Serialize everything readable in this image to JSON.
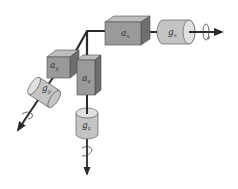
{
  "diagram": {
    "type": "imu-sensor-axes",
    "colors": {
      "background": "#ffffff",
      "box_front": "#9a9a9a",
      "box_top": "#bdbdbd",
      "box_side": "#6e6e6e",
      "cylinder_body": "#c4c4c4",
      "cylinder_cap": "#e0e0e0",
      "axis_line": "#2a2a2a",
      "outline": "#4a4a4a"
    },
    "accelerometers": [
      {
        "id": "ax",
        "symbol": "a",
        "subscript": "x"
      },
      {
        "id": "ay",
        "symbol": "a",
        "subscript": "y"
      },
      {
        "id": "az",
        "symbol": "a",
        "subscript": "z"
      }
    ],
    "gyroscopes": [
      {
        "id": "gx",
        "symbol": "g",
        "subscript": "x"
      },
      {
        "id": "gy",
        "symbol": "g",
        "subscript": "y"
      },
      {
        "id": "gz",
        "symbol": "g",
        "subscript": "z"
      }
    ]
  }
}
